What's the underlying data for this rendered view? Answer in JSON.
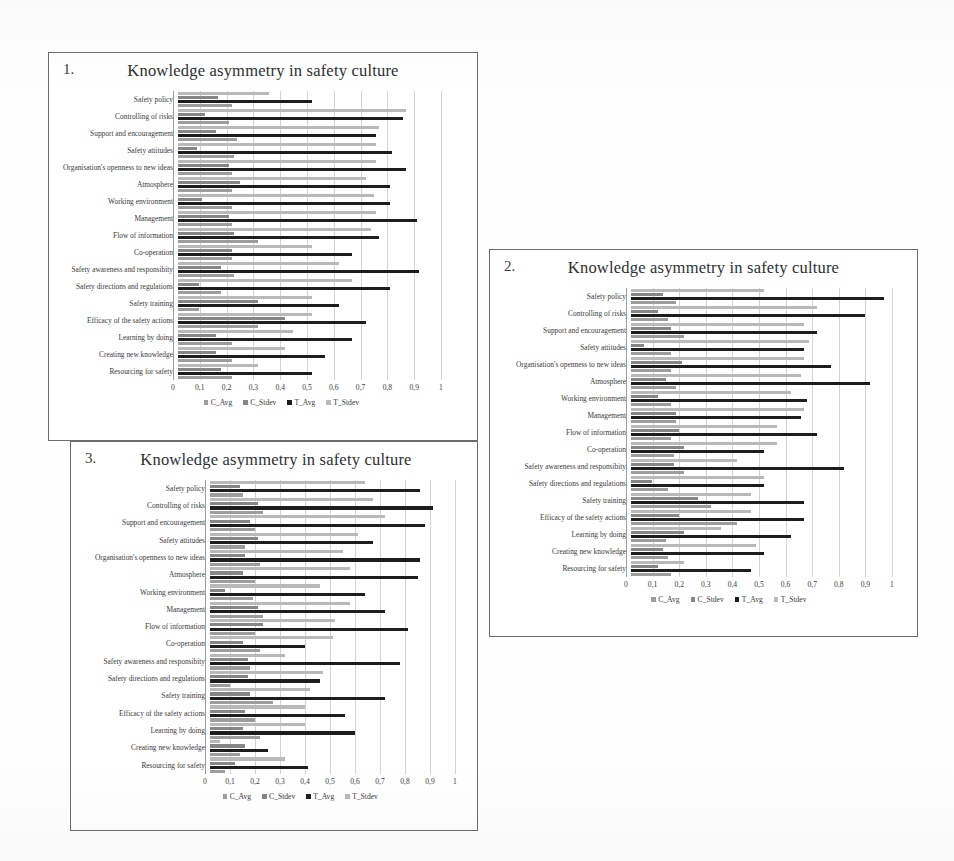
{
  "page": {
    "background_color": "#fefefe",
    "charts_count": 3
  },
  "series_colors": {
    "C_Avg": "#9d9d9d",
    "C_Stdev": "#868686",
    "T_Avg": "#1d1d1d",
    "T_Stdev": "#b9b9b9"
  },
  "axis": {
    "ticks": [
      "0",
      "0,1",
      "0,2",
      "0,3",
      "0,4",
      "0,5",
      "0,6",
      "0,7",
      "0,8",
      "0,9",
      "1"
    ],
    "values": [
      0,
      0.1,
      0.2,
      0.3,
      0.4,
      0.5,
      0.6,
      0.7,
      0.8,
      0.9,
      1
    ]
  },
  "legend": {
    "items": [
      {
        "label": "C_Avg",
        "color": "#9d9d9d"
      },
      {
        "label": "C_Stdev",
        "color": "#868686"
      },
      {
        "label": "T_Avg",
        "color": "#1d1d1d"
      },
      {
        "label": "T_Stdev",
        "color": "#b9b9b9"
      }
    ]
  },
  "charts": [
    {
      "index": "1.",
      "title": "Knowledge asymmetry in safety culture"
    },
    {
      "index": "2.",
      "title": "Knowledge asymmetry in safety culture"
    },
    {
      "index": "3.",
      "title": "Knowledge asymmetry in safety culture"
    }
  ],
  "chart_data": [
    {
      "type": "bar",
      "orientation": "horizontal",
      "id": "chart-1",
      "index_label": "1.",
      "title": "Knowledge asymmetry in safety culture",
      "xlabel": "",
      "ylabel": "",
      "xlim": [
        0,
        1
      ],
      "grid": true,
      "legend_position": "bottom",
      "categories": [
        "Safety policy",
        "Controlling of risks",
        "Support and encouragement",
        "Safety attitudes",
        "Organisation's openness to new ideas",
        "Atmosphere",
        "Working environment",
        "Management",
        "Flow of information",
        "Co-operation",
        "Safety awareness and responsibity",
        "Safety directions and regulations",
        "Safety training",
        "Efficacy of the safety actions",
        "Learning by doing",
        "Creating new knowledge",
        "Resourcing for safety"
      ],
      "series": [
        {
          "name": "T_Stdev",
          "values": [
            0.34,
            0.85,
            0.75,
            0.74,
            0.74,
            0.7,
            0.73,
            0.74,
            0.72,
            0.5,
            0.6,
            0.65,
            0.5,
            0.5,
            0.43,
            0.4,
            0.3
          ]
        },
        {
          "name": "C_Stdev",
          "values": [
            0.15,
            0.1,
            0.14,
            0.07,
            0.19,
            0.23,
            0.09,
            0.19,
            0.21,
            0.2,
            0.16,
            0.08,
            0.3,
            0.4,
            0.14,
            0.14,
            0.16
          ]
        },
        {
          "name": "T_Avg",
          "values": [
            0.5,
            0.84,
            0.74,
            0.8,
            0.85,
            0.79,
            0.79,
            0.89,
            0.75,
            0.65,
            0.9,
            0.79,
            0.6,
            0.7,
            0.65,
            0.55,
            0.5
          ]
        },
        {
          "name": "C_Avg",
          "values": [
            0.2,
            0.19,
            0.22,
            0.21,
            0.2,
            0.2,
            0.2,
            0.2,
            0.3,
            0.2,
            0.21,
            0.16,
            0.08,
            0.3,
            0.2,
            0.2,
            0.2
          ]
        }
      ]
    },
    {
      "type": "bar",
      "orientation": "horizontal",
      "id": "chart-2",
      "index_label": "2.",
      "title": "Knowledge asymmetry in safety culture",
      "xlabel": "",
      "ylabel": "",
      "xlim": [
        0,
        1
      ],
      "grid": true,
      "legend_position": "bottom",
      "categories": [
        "Safety policy",
        "Controlling of risks",
        "Support and encouragement",
        "Safety attitudes",
        "Organisation's openness to new ideas",
        "Atmosphere",
        "Working environment",
        "Management",
        "Flow of information",
        "Co-operation",
        "Safety awareness and responsibity",
        "Safety directions and regulations",
        "Safety training",
        "Efficacy of the safety actions",
        "Learning by doing",
        "Creating new knowledge",
        "Resourcing for safety"
      ],
      "series": [
        {
          "name": "T_Stdev",
          "values": [
            0.5,
            0.7,
            0.65,
            0.67,
            0.65,
            0.64,
            0.6,
            0.65,
            0.55,
            0.55,
            0.4,
            0.5,
            0.45,
            0.45,
            0.34,
            0.47,
            0.2
          ]
        },
        {
          "name": "C_Stdev",
          "values": [
            0.12,
            0.1,
            0.15,
            0.05,
            0.19,
            0.13,
            0.1,
            0.17,
            0.18,
            0.2,
            0.16,
            0.08,
            0.25,
            0.18,
            0.2,
            0.12,
            0.1
          ]
        },
        {
          "name": "T_Avg",
          "values": [
            0.95,
            0.88,
            0.7,
            0.65,
            0.75,
            0.9,
            0.66,
            0.64,
            0.7,
            0.5,
            0.8,
            0.5,
            0.65,
            0.65,
            0.6,
            0.5,
            0.45
          ]
        },
        {
          "name": "C_Avg",
          "values": [
            0.17,
            0.14,
            0.2,
            0.15,
            0.15,
            0.17,
            0.15,
            0.17,
            0.15,
            0.16,
            0.2,
            0.14,
            0.3,
            0.4,
            0.13,
            0.14,
            0.15
          ]
        }
      ]
    },
    {
      "type": "bar",
      "orientation": "horizontal",
      "id": "chart-3",
      "index_label": "3.",
      "title": "Knowledge asymmetry in safety culture",
      "xlabel": "",
      "ylabel": "",
      "xlim": [
        0,
        1
      ],
      "grid": true,
      "legend_position": "bottom",
      "categories": [
        "Safety policy",
        "Controlling of risks",
        "Support and encouragement",
        "Safety attitudes",
        "Organisation's openness to new ideas",
        "Atmosphere",
        "Working environment",
        "Management",
        "Flow of information",
        "Co-operation",
        "Safety awareness and responsibity",
        "Safety directions and regulations",
        "Safety training",
        "Efficacy of the safety actions",
        "Learning by doing",
        "Creating new knowledge",
        "Resourcing for safety"
      ],
      "series": [
        {
          "name": "T_Stdev",
          "values": [
            0.62,
            0.65,
            0.7,
            0.59,
            0.53,
            0.56,
            0.44,
            0.56,
            0.5,
            0.49,
            0.3,
            0.45,
            0.4,
            0.38,
            0.38,
            0.04,
            0.3
          ]
        },
        {
          "name": "C_Stdev",
          "values": [
            0.12,
            0.19,
            0.16,
            0.19,
            0.14,
            0.13,
            0.06,
            0.19,
            0.21,
            0.13,
            0.15,
            0.15,
            0.16,
            0.14,
            0.13,
            0.14,
            0.1
          ]
        },
        {
          "name": "T_Avg",
          "values": [
            0.84,
            0.89,
            0.86,
            0.65,
            0.84,
            0.83,
            0.62,
            0.7,
            0.79,
            0.38,
            0.76,
            0.44,
            0.7,
            0.54,
            0.58,
            0.23,
            0.39
          ]
        },
        {
          "name": "C_Avg",
          "values": [
            0.13,
            0.21,
            0.18,
            0.14,
            0.2,
            0.18,
            0.17,
            0.21,
            0.18,
            0.2,
            0.16,
            0.08,
            0.25,
            0.18,
            0.2,
            0.12,
            0.06
          ]
        }
      ]
    }
  ]
}
